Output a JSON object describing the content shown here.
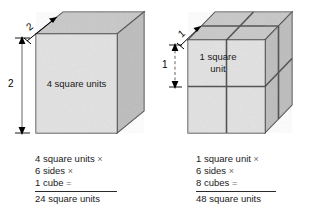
{
  "figure": {
    "kind": "surface-area-diagram",
    "background_color": "#ffffff",
    "ink_color": "#000000"
  },
  "palette": {
    "front_face": "#e3e3e3",
    "top_face": "#c9c9c9",
    "side_face": "#bdbdbd",
    "edge": "#3a3a3a",
    "inner_edge": "#555555",
    "rule": "#2a2a2a",
    "operator": "#6e6e6e"
  },
  "left": {
    "cube": {
      "name": "large-cube",
      "divisions": 1,
      "edge_units": 2
    },
    "dimensions": [
      {
        "id": "depth",
        "label": "2",
        "orientation": "diagonal"
      },
      {
        "id": "height",
        "label": "2",
        "orientation": "vertical"
      }
    ],
    "face_label": "4 square units",
    "calc": {
      "lines": [
        {
          "text": "4 square units",
          "op": "×"
        },
        {
          "text": "6 sides",
          "op": "×"
        },
        {
          "text": "1 cube",
          "op": "="
        }
      ],
      "result": "24 square units"
    }
  },
  "right": {
    "cube": {
      "name": "subdivided-cube",
      "divisions": 2,
      "edge_units": 2,
      "sub_cubes": 8
    },
    "dimensions": [
      {
        "id": "depth",
        "label": "1",
        "orientation": "diagonal"
      },
      {
        "id": "height",
        "label": "1",
        "orientation": "vertical"
      }
    ],
    "face_label": "1 square unit",
    "calc": {
      "lines": [
        {
          "text": "1 square unit",
          "op": "×"
        },
        {
          "text": "6 sides",
          "op": "×"
        },
        {
          "text": "8 cubes",
          "op": "="
        }
      ],
      "result": "48 square units"
    }
  }
}
